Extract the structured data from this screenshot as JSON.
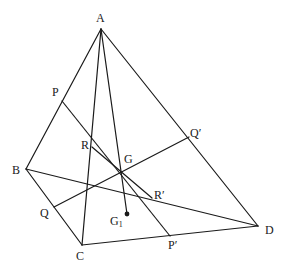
{
  "diagram": {
    "type": "geometric-figure",
    "points": {
      "A": {
        "label": "A",
        "x": 101,
        "y": 29
      },
      "B": {
        "label": "B",
        "x": 26,
        "y": 169
      },
      "C": {
        "label": "C",
        "x": 82,
        "y": 245
      },
      "D": {
        "label": "D",
        "x": 258,
        "y": 226
      },
      "P": {
        "label": "P",
        "x": 62,
        "y": 101
      },
      "Q": {
        "label": "Q",
        "x": 54,
        "y": 207
      },
      "Qp": {
        "label": "Q′",
        "x": 189,
        "y": 137
      },
      "Pp": {
        "label": "P′",
        "x": 170,
        "y": 236
      },
      "R": {
        "label": "R",
        "x": 92,
        "y": 147
      },
      "Rp": {
        "label": "R′",
        "x": 152,
        "y": 198
      },
      "G": {
        "label": "G",
        "x": 121,
        "y": 172
      },
      "G1": {
        "label": "G",
        "sub": "1",
        "x": 127,
        "y": 214
      }
    },
    "segments": [
      {
        "from": "A",
        "to": "B"
      },
      {
        "from": "B",
        "to": "C"
      },
      {
        "from": "C",
        "to": "D"
      },
      {
        "from": "A",
        "to": "D"
      },
      {
        "from": "A",
        "to": "C"
      },
      {
        "from": "B",
        "to": "D"
      },
      {
        "from": "A",
        "to": "G1"
      },
      {
        "from": "P",
        "to": "Pp"
      },
      {
        "from": "Q",
        "to": "Qp"
      },
      {
        "from": "R",
        "to": "Rp"
      }
    ],
    "labels": {
      "A": "A",
      "B": "B",
      "C": "C",
      "D": "D",
      "P": "P",
      "Q": "Q",
      "R": "R",
      "G": "G",
      "Pp": "P′",
      "Qp": "Q′",
      "Rp": "R′",
      "G1_main": "G",
      "G1_sub": "1"
    }
  }
}
